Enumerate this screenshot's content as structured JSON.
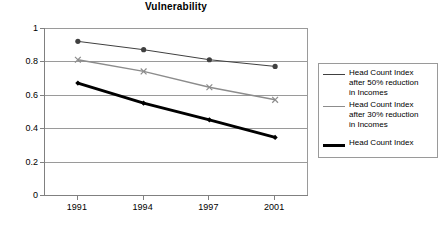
{
  "chart_data": {
    "type": "line",
    "title": "Vulnerability",
    "xlabel": "",
    "ylabel": "",
    "categories": [
      "1991",
      "1994",
      "1997",
      "2001"
    ],
    "x": [
      1991,
      1994,
      1997,
      2001
    ],
    "ylim": [
      0,
      1
    ],
    "yticks": [
      "0",
      "0.2",
      "0.4",
      "0.6",
      "0.8",
      "1"
    ],
    "grid": true,
    "legend_position": "right",
    "series": [
      {
        "name": "Head Count Index after 50% reduction in Incomes",
        "values": [
          0.92,
          0.87,
          0.81,
          0.77
        ],
        "color": "#404040",
        "marker": "circle",
        "line_width": 1
      },
      {
        "name": "Head Count Index after 30% reduction in Incomes",
        "values": [
          0.81,
          0.74,
          0.645,
          0.57
        ],
        "color": "#8c8c8c",
        "marker": "x",
        "line_width": 1.4
      },
      {
        "name": "Head Count Index",
        "values": [
          0.67,
          0.55,
          0.45,
          0.345
        ],
        "color": "#000000",
        "marker": "diamond",
        "line_width": 3
      }
    ]
  },
  "legend": {
    "entries": [
      {
        "label": "Head Count Index\nafter 50% reduction\nin Incomes"
      },
      {
        "label": "Head Count Index\nafter 30% reduction\nin Incomes"
      },
      {
        "label": "Head Count Index"
      }
    ]
  }
}
